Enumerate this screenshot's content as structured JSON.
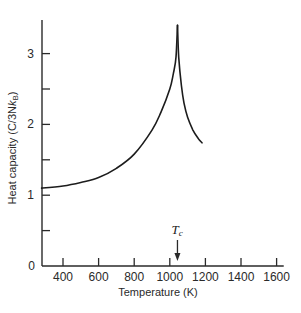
{
  "chart_data": {
    "type": "line",
    "title": "",
    "xlabel": "Temperature (K)",
    "ylabel": "Heat capacity (C/3Nk_B)",
    "ylabel_parts": {
      "main": "Heat capacity (C/3N",
      "k": "k",
      "sub": "B",
      "close": ")"
    },
    "xlim": [
      280,
      1640
    ],
    "ylim": [
      0,
      3.45
    ],
    "x_ticks": [
      400,
      600,
      800,
      1000,
      1200,
      1400,
      1600
    ],
    "x_tick_labels": [
      "400",
      "600",
      "800",
      "1000",
      "1200",
      "1400",
      "1600"
    ],
    "y_ticks": [
      0,
      0.5,
      1,
      1.5,
      2,
      2.5,
      3
    ],
    "y_tick_labels": [
      "0",
      "",
      "1",
      "",
      "2",
      "",
      "3"
    ],
    "grid": false,
    "legend": null,
    "annotations": [
      {
        "text": "T_c",
        "label_main": "T",
        "label_sub": "c",
        "x": 1043,
        "type": "arrow-down"
      }
    ],
    "series": [
      {
        "name": "below Tc",
        "x": [
          280,
          400,
          500,
          600,
          700,
          800,
          900,
          950,
          1000,
          1020,
          1035,
          1043
        ],
        "y": [
          1.1,
          1.13,
          1.18,
          1.25,
          1.38,
          1.58,
          1.92,
          2.17,
          2.5,
          2.72,
          2.95,
          3.4
        ]
      },
      {
        "name": "above Tc",
        "x": [
          1043,
          1050,
          1065,
          1080,
          1100,
          1130,
          1160,
          1181
        ],
        "y": [
          3.4,
          2.95,
          2.55,
          2.3,
          2.1,
          1.92,
          1.8,
          1.74
        ]
      }
    ]
  },
  "colors": {
    "line": "#1c1c1c",
    "axis": "#2a2a2a",
    "background": "#ffffff"
  }
}
